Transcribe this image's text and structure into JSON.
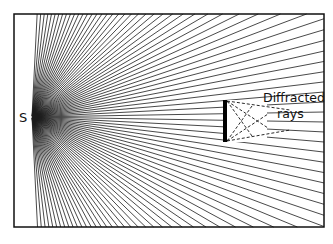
{
  "diagram": {
    "type": "wave-diffraction",
    "source_label": "S",
    "annotation_line1": "Diffracted",
    "annotation_line2": "rays",
    "frame": {
      "x": 14,
      "y": 14,
      "width": 310,
      "height": 213
    },
    "source_point": {
      "x": 32,
      "y": 117
    },
    "ray_count": 90,
    "obstacle": {
      "x": 223,
      "y": 100,
      "width": 4,
      "height": 42
    },
    "colors": {
      "lines": "#111111",
      "background": "#ffffff"
    }
  }
}
